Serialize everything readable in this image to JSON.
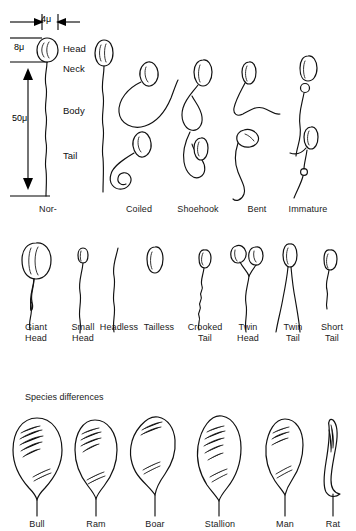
{
  "figure": {
    "title_visible": false,
    "sections": [
      {
        "id": "normal-and-abnormal",
        "heading": ""
      },
      {
        "id": "abnormal-row-2",
        "heading": ""
      },
      {
        "id": "species",
        "heading": "Species differences"
      }
    ]
  },
  "measurements": {
    "width_label": "4μ",
    "head_height_label": "8μ",
    "total_length_label": "50μ"
  },
  "anatomy": {
    "parts": [
      {
        "name": "head",
        "label": "Head"
      },
      {
        "name": "neck",
        "label": "Neck"
      },
      {
        "name": "body",
        "label": "Body"
      },
      {
        "name": "tail",
        "label": "Tail"
      }
    ]
  },
  "row_top": {
    "items": [
      {
        "id": "normal",
        "label": "Nor-",
        "count": 1
      },
      {
        "id": "coiled",
        "label": "Coiled",
        "count": 2
      },
      {
        "id": "shoehook",
        "label": "Shoehook",
        "count": 2
      },
      {
        "id": "bent",
        "label": "Bent",
        "count": 2
      },
      {
        "id": "immature",
        "label": "Immature",
        "count": 2
      }
    ]
  },
  "row_middle": {
    "items": [
      {
        "id": "giant-head",
        "label": "Giant\nHead"
      },
      {
        "id": "small-head",
        "label": "Small\nHead"
      },
      {
        "id": "headless",
        "label": "Headless"
      },
      {
        "id": "tailless",
        "label": "Tailless"
      },
      {
        "id": "crooked-tail",
        "label": "Crooked\nTail"
      },
      {
        "id": "twin-head",
        "label": "Twin\nHead"
      },
      {
        "id": "twin-tail",
        "label": "Twin\nTail"
      },
      {
        "id": "short-tail",
        "label": "Short\nTail"
      }
    ]
  },
  "row_species": {
    "heading": "Species differences",
    "items": [
      {
        "id": "bull",
        "label": "Bull"
      },
      {
        "id": "ram",
        "label": "Ram"
      },
      {
        "id": "boar",
        "label": "Boar"
      },
      {
        "id": "stallion",
        "label": "Stallion"
      },
      {
        "id": "man",
        "label": "Man"
      },
      {
        "id": "rat",
        "label": "Rat"
      }
    ]
  },
  "colors": {
    "ink": "#111111",
    "background": "#ffffff",
    "text": "#1a1a1a"
  }
}
